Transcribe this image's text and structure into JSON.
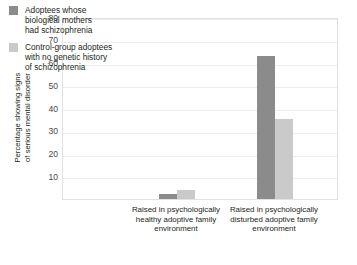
{
  "chart_data": {
    "type": "bar",
    "title": "",
    "xlabel": "",
    "ylabel": "Percentage showing signs\nof serious mental disorder",
    "ylim": [
      0,
      80
    ],
    "yticks": [
      80,
      70,
      60,
      50,
      40,
      30,
      20,
      10
    ],
    "grid": true,
    "legend_position": "top-left-inside",
    "categories": [
      "Raised in psychologically\nhealthy adoptive family\nenvironment",
      "Raised in psychologically\ndisturbed adoptive family\nenvironment"
    ],
    "series": [
      {
        "name": "Adoptees whose\nbiological mothers\nhad schizophrenia",
        "color": "#8b8b8b",
        "values": [
          2,
          63
        ]
      },
      {
        "name": "Control-group adoptees\nwith no genetic history\nof schizophrenia",
        "color": "#cacaca",
        "values": [
          4,
          35
        ]
      }
    ]
  },
  "axis": {
    "y_title": "Percentage showing signs\nof serious mental disorder",
    "y_tick_labels": [
      "80",
      "70",
      "60",
      "50",
      "40",
      "30",
      "20",
      "10"
    ]
  },
  "legend": {
    "items": [
      {
        "label": "Adoptees whose\nbiological mothers\nhad schizophrenia"
      },
      {
        "label": "Control-group adoptees\nwith no genetic history\nof schizophrenia"
      }
    ]
  },
  "categories": [
    {
      "label": "Raised in psychologically\nhealthy adoptive family\nenvironment"
    },
    {
      "label": "Raised in psychologically\ndisturbed adoptive family\nenvironment"
    }
  ]
}
